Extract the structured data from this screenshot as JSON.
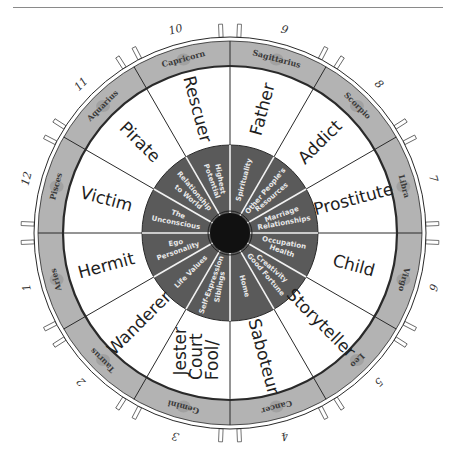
{
  "figure": {
    "type": "twelve-house archetype wheel",
    "center": {
      "x": 230,
      "y": 233
    },
    "colors": {
      "zodiac_band": "#b3b3b3",
      "inner_wheel": "#5a5a5a",
      "center_hub": "#111111",
      "house_area": "#ffffff",
      "lines": "#2a2a2a"
    }
  },
  "houses": [
    {
      "number": "1",
      "archetype": "Hermit",
      "inner": [
        "Ego",
        "Personality"
      ],
      "sign": "Aries"
    },
    {
      "number": "2",
      "archetype": "Wanderer",
      "inner": [
        "Life Values"
      ],
      "sign": "Taurus"
    },
    {
      "number": "3",
      "archetype": "Fool/ Court Jester",
      "inner": [
        "Self-Expression",
        "Siblings"
      ],
      "sign": "Gemini"
    },
    {
      "number": "4",
      "archetype": "Saboteur",
      "inner": [
        "Home"
      ],
      "sign": "Cancer"
    },
    {
      "number": "5",
      "archetype": "Storyteller",
      "inner": [
        "Creativity",
        "Good Fortune"
      ],
      "sign": "Leo"
    },
    {
      "number": "6",
      "archetype": "Child",
      "inner": [
        "Occupation",
        "Health"
      ],
      "sign": "Virgo"
    },
    {
      "number": "7",
      "archetype": "Prostitute",
      "inner": [
        "Marriage",
        "Relationships"
      ],
      "sign": "Libra"
    },
    {
      "number": "8",
      "archetype": "Addict",
      "inner": [
        "Other People's",
        "Resources"
      ],
      "sign": "Scorpio"
    },
    {
      "number": "9",
      "archetype": "Father",
      "inner": [
        "Spirituality"
      ],
      "sign": "Sagittarius"
    },
    {
      "number": "10",
      "archetype": "Rescuer",
      "inner": [
        "Highest",
        "Potential"
      ],
      "sign": "Capricorn"
    },
    {
      "number": "11",
      "archetype": "Pirate",
      "inner": [
        "Relationship",
        "to World"
      ],
      "sign": "Aquarius"
    },
    {
      "number": "12",
      "archetype": "Victim",
      "inner": [
        "The",
        "Unconscious"
      ],
      "sign": "Pisces"
    }
  ],
  "fool_lines": [
    "Fool/",
    "Court",
    "Jester"
  ]
}
